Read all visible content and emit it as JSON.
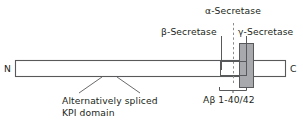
{
  "figure": {
    "type": "diagram"
  },
  "terminals": {
    "n_terminus": "N",
    "c_terminus": "C"
  },
  "labels": {
    "alpha_secretase": "α-Secretase",
    "beta_secretase": "β-Secretase",
    "gamma_secretase": "γ-Secretase",
    "abeta_span": "Aβ 1-40/42",
    "alt_spliced_line1": "Alternatively spliced",
    "alt_spliced_line2": "KPI domain"
  },
  "colors": {
    "background": "#ffffff",
    "stroke": "#58595b",
    "text": "#231f20",
    "membrane_fill": "#a7a9ac",
    "bar_fill": "#ffffff"
  },
  "geometry": {
    "bar": {
      "x": 15,
      "y": 60,
      "width": 271,
      "height": 17
    },
    "membrane_box": {
      "x": 239,
      "y": 43,
      "width": 15,
      "height": 45
    },
    "abeta_box": {
      "x": 220,
      "y": 61,
      "width": 27,
      "height": 15
    },
    "alpha_dashed_x": 233,
    "beta_leader_x": 221,
    "gamma_leader_x": 246,
    "bracket": {
      "x1": 219,
      "x2": 247,
      "y": 90
    },
    "kpi_leaders": [
      {
        "x_top": 102,
        "x_bottom": 79
      },
      {
        "x_top": 117,
        "x_bottom": 140
      }
    ]
  }
}
